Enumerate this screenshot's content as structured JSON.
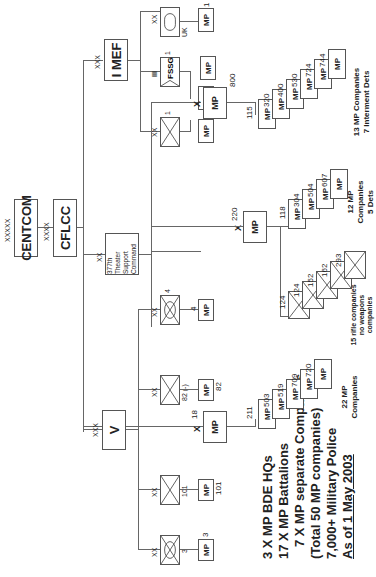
{
  "summary": {
    "line1": "3 X MP BDE HQs",
    "line2": "17 X MP Battalions",
    "line3": "7 X MP separate Companies",
    "line4": "(Total 50 MP companies)",
    "line5": "7,000+ Military Police",
    "line6": "As of 1 May 2003"
  },
  "top": {
    "centcom": {
      "echelon": "XXXXX",
      "label": "CENTCOM"
    },
    "cflcc": {
      "echelon": "XXXX",
      "label": "CFLCC"
    }
  },
  "commands": {
    "v_corps": {
      "echelon": "XXX",
      "label": "V"
    },
    "tsc": {
      "echelon": "XX",
      "label_line1": "377th Theater",
      "label_line2": "Support Command"
    },
    "imef": {
      "echelon": "XXX",
      "label": "I MEF"
    }
  },
  "v_divisions": [
    {
      "echelon": "XX",
      "designation": "3",
      "mp_label": "MP",
      "mp_number": "3"
    },
    {
      "echelon": "XX",
      "designation": "101",
      "mp_label": "MP",
      "mp_number": "101"
    },
    {
      "echelon": "XX",
      "designation": "82 (-)",
      "mp_label": "MP",
      "mp_number": "82"
    },
    {
      "echelon": "XX",
      "designation": "4",
      "mp_label": "MP",
      "mp_number": "4"
    }
  ],
  "bde_18": {
    "echelon": "X",
    "label": "MP",
    "number": "18",
    "companies": [
      "211",
      "503",
      "519",
      "709",
      "720"
    ],
    "company_label": "MP",
    "note_line1": "22 MP",
    "note_line2": "Companies"
  },
  "bde_220": {
    "echelon": "X",
    "label": "MP",
    "number": "220",
    "rifle_units": [
      {
        "number": "124",
        "size": "1"
      },
      {
        "number": "124",
        "size": "3"
      },
      {
        "number": "152",
        "size": "1"
      },
      {
        "number": "162",
        "size": "1"
      },
      {
        "number": "293",
        "size": "1"
      }
    ],
    "rifle_note_line1": "15 rifle companies",
    "rifle_note_line2": "no weapons",
    "rifle_note_line3": "companies",
    "companies": [
      "118",
      "304",
      "504",
      "607"
    ],
    "company_label": "MP",
    "note_line1": "12 MP",
    "note_line2": "Companies",
    "note_line3": "5 Dets"
  },
  "bde_800": {
    "echelon": "X",
    "label": "MP",
    "number": "800",
    "companies": [
      "115",
      "320",
      "400",
      "530",
      "724",
      "744"
    ],
    "company_label": "MP",
    "note_line1": "13 MP Companies",
    "note_line2": "7 Interment Dets"
  },
  "imef_units": [
    {
      "echelon": "XX",
      "size": "1",
      "type": "infantry",
      "mp_label": "MP"
    },
    {
      "echelon": "III",
      "size": "1",
      "label": "FSSG",
      "mp_label": "MP",
      "mp_number": "716",
      "mp2_label": "MP"
    },
    {
      "echelon": "XX",
      "size": "1",
      "suffix": "UK",
      "type": "armor",
      "mp_label": "MP",
      "mp_number": "1"
    }
  ]
}
